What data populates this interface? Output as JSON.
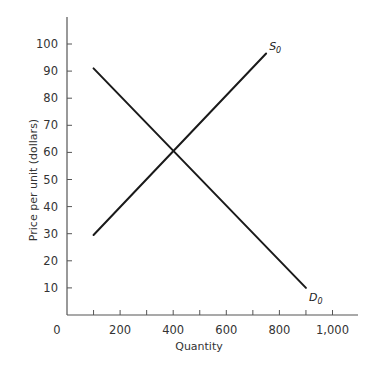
{
  "chart_data": {
    "type": "line",
    "title": "",
    "xlabel": "Quantity",
    "ylabel": "Price per unit (dollars)",
    "xlim": [
      0,
      1100
    ],
    "ylim": [
      0,
      110
    ],
    "x_ticks": [
      100,
      200,
      300,
      400,
      500,
      600,
      700,
      800,
      900,
      1000
    ],
    "x_tick_labels": [
      "0",
      "200",
      "400",
      "600",
      "800",
      "1,000"
    ],
    "y_ticks": [
      10,
      20,
      30,
      40,
      50,
      60,
      70,
      80,
      90,
      100
    ],
    "y_tick_labels": [
      "10",
      "20",
      "30",
      "40",
      "50",
      "60",
      "70",
      "80",
      "90",
      "100"
    ],
    "grid": false,
    "legend": "inline labels at line ends",
    "series": [
      {
        "name": "S0",
        "label_main": "S",
        "label_sub": "0",
        "points": [
          [
            100,
            29.5
          ],
          [
            750,
            96.5
          ]
        ]
      },
      {
        "name": "D0",
        "label_main": "D",
        "label_sub": "0",
        "points": [
          [
            100,
            91
          ],
          [
            900,
            10
          ]
        ]
      }
    ],
    "annotations": [
      {
        "text": "equilibrium intersection",
        "x": 400,
        "y": 60
      }
    ]
  }
}
